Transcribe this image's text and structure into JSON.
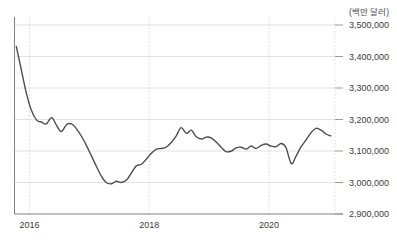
{
  "chart_data": {
    "type": "line",
    "title": "",
    "subtitle": "",
    "unit_label": "(백만 달러)",
    "xlabel": "",
    "ylabel": "",
    "ylim": [
      2900000,
      3500000
    ],
    "xlim": [
      2015.75,
      2021.1
    ],
    "grid": true,
    "legend": null,
    "y_ticks": [
      {
        "value": 3500000,
        "label": "3,500,000"
      },
      {
        "value": 3400000,
        "label": "3,400,000"
      },
      {
        "value": 3300000,
        "label": "3,300,000"
      },
      {
        "value": 3200000,
        "label": "3,200,000"
      },
      {
        "value": 3100000,
        "label": "3,100,000"
      },
      {
        "value": 3000000,
        "label": "3,000,000"
      },
      {
        "value": 2900000,
        "label": "2,900,000"
      }
    ],
    "x_ticks": [
      {
        "value": 2016,
        "label": "2016"
      },
      {
        "value": 2018,
        "label": "2018"
      },
      {
        "value": 2020,
        "label": "2020"
      }
    ],
    "line_color": "#4d4d4d",
    "grid_color": "#e2e2e2",
    "axis_color": "#808080",
    "series": [
      {
        "name": "series-1",
        "x": [
          2015.78,
          2015.87,
          2015.95,
          2016.03,
          2016.12,
          2016.2,
          2016.28,
          2016.37,
          2016.45,
          2016.53,
          2016.62,
          2016.7,
          2016.78,
          2016.87,
          2016.95,
          2017.03,
          2017.12,
          2017.2,
          2017.28,
          2017.37,
          2017.45,
          2017.53,
          2017.62,
          2017.7,
          2017.78,
          2017.87,
          2017.95,
          2018.03,
          2018.12,
          2018.2,
          2018.28,
          2018.37,
          2018.45,
          2018.53,
          2018.62,
          2018.7,
          2018.78,
          2018.87,
          2018.95,
          2019.03,
          2019.12,
          2019.2,
          2019.28,
          2019.37,
          2019.45,
          2019.53,
          2019.62,
          2019.7,
          2019.78,
          2019.87,
          2019.95,
          2020.03,
          2020.12,
          2020.2,
          2020.28,
          2020.37,
          2020.45,
          2020.53,
          2020.62,
          2020.7,
          2020.78,
          2020.87,
          2020.95,
          2021.03
        ],
        "values": [
          3432000,
          3352000,
          3282000,
          3230000,
          3198000,
          3192000,
          3186000,
          3206000,
          3182000,
          3162000,
          3184000,
          3186000,
          3172000,
          3146000,
          3118000,
          3086000,
          3050000,
          3020000,
          3000000,
          2996000,
          3004000,
          3000000,
          3008000,
          3030000,
          3052000,
          3058000,
          3074000,
          3092000,
          3106000,
          3108000,
          3112000,
          3128000,
          3148000,
          3174000,
          3156000,
          3166000,
          3146000,
          3138000,
          3144000,
          3142000,
          3128000,
          3112000,
          3098000,
          3100000,
          3110000,
          3112000,
          3106000,
          3116000,
          3108000,
          3118000,
          3122000,
          3116000,
          3114000,
          3124000,
          3112000,
          3060000,
          3084000,
          3112000,
          3136000,
          3158000,
          3172000,
          3166000,
          3154000,
          3148000
        ]
      }
    ]
  }
}
